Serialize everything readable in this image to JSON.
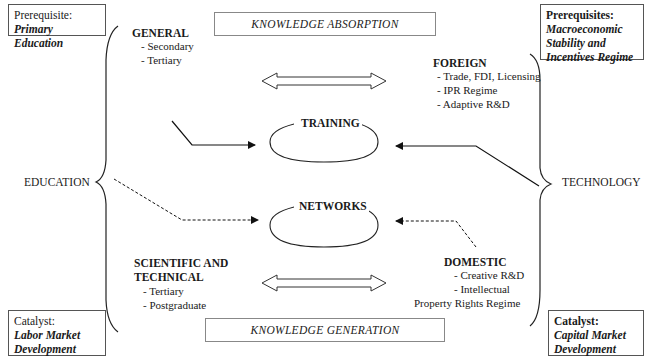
{
  "corners": {
    "top_left": {
      "label": "Prerequisite:",
      "value": "Primary Education"
    },
    "top_right": {
      "label": "Prerequisites:",
      "lines": [
        "Macroeconomic",
        "Stability and",
        "Incentives Regime"
      ]
    },
    "bottom_left": {
      "label": "Catalyst:",
      "lines": [
        "Labor Market",
        "Development"
      ]
    },
    "bottom_right": {
      "label": "Catalyst:",
      "lines": [
        "Capital Market",
        "Development"
      ]
    }
  },
  "banners": {
    "top": "KNOWLEDGE ABSORPTION",
    "bottom": "KNOWLEDGE GENERATION"
  },
  "left": {
    "label": "EDUCATION",
    "general": {
      "heading": "GENERAL",
      "items": [
        "- Secondary",
        "- Tertiary"
      ]
    },
    "scientific": {
      "heading_lines": [
        "SCIENTIFIC AND",
        "TECHNICAL"
      ],
      "items": [
        "- Tertiary",
        "- Postgraduate"
      ]
    }
  },
  "right": {
    "label": "TECHNOLOGY",
    "foreign": {
      "heading": "FOREIGN",
      "items": [
        "- Trade, FDI, Licensing",
        "- IPR Regime",
        "- Adaptive R&D"
      ]
    },
    "domestic": {
      "heading": "DOMESTIC",
      "items": [
        "- Creative R&D",
        "- Intellectual",
        "Property Rights Regime"
      ]
    }
  },
  "center": {
    "training": "TRAINING",
    "networks": "NETWORKS"
  }
}
